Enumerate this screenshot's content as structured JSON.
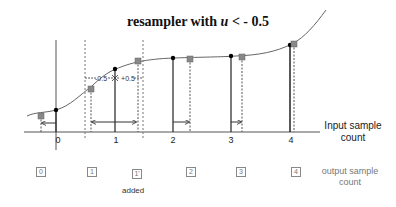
{
  "title": {
    "prefix": "resampler with ",
    "var": "u",
    "suffix": " < - 0.5"
  },
  "input_axis": {
    "label_line1": "Input sample",
    "label_line2": "count",
    "ticks": [
      "0",
      "1",
      "2",
      "3",
      "4"
    ]
  },
  "offset_labels": {
    "minus": "-0.5",
    "plus": "+0.5"
  },
  "output_axis": {
    "label_line1": "output sample",
    "label_line2": "count",
    "samples": [
      {
        "label": "0"
      },
      {
        "label": "1"
      },
      {
        "label": "1'"
      },
      {
        "label": "2"
      },
      {
        "label": "3"
      },
      {
        "label": "4"
      }
    ],
    "added_label": "added"
  },
  "colors": {
    "curve": "#555555",
    "input_marker": "#000000",
    "output_marker": "#888888",
    "axis": "#333333"
  }
}
